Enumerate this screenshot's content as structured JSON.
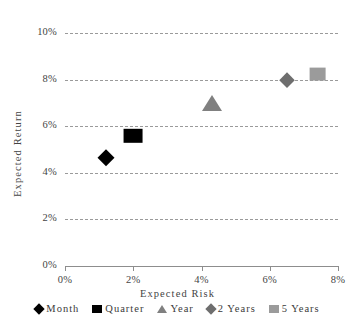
{
  "chart_data": {
    "type": "scatter",
    "title": "",
    "xlabel": "Expected Risk",
    "ylabel": "Expected Return",
    "xlim": [
      0,
      8
    ],
    "ylim": [
      0,
      10
    ],
    "xticks": [
      "0%",
      "2%",
      "4%",
      "6%",
      "8%"
    ],
    "yticks": [
      "0%",
      "2%",
      "4%",
      "6%",
      "8%",
      "10%"
    ],
    "xtick_values": [
      0,
      2,
      4,
      6,
      8
    ],
    "ytick_values": [
      0,
      2,
      4,
      6,
      8,
      10
    ],
    "grid": true,
    "grid_style": "dashed-horizontal",
    "legend_position": "bottom",
    "points": [
      {
        "name": "Month",
        "x": 1.2,
        "y": 4.65,
        "marker": "diamond",
        "color": "#000000",
        "size": 17
      },
      {
        "name": "Quarter",
        "x": 2.0,
        "y": 5.6,
        "marker": "square",
        "color": "#000000",
        "size": 18
      },
      {
        "name": "Year",
        "x": 4.3,
        "y": 7.0,
        "marker": "triangle",
        "color": "#808080",
        "size": 20
      },
      {
        "name": "2 Years",
        "x": 6.5,
        "y": 8.0,
        "marker": "diamond",
        "color": "#6e6e6e",
        "size": 15
      },
      {
        "name": "5 Years",
        "x": 7.4,
        "y": 8.25,
        "marker": "square",
        "color": "#9b9b9b",
        "size": 16
      }
    ],
    "series": [
      {
        "name": "Month",
        "values": [
          {
            "x": 1.2,
            "y": 4.65
          }
        ]
      },
      {
        "name": "Quarter",
        "values": [
          {
            "x": 2.0,
            "y": 5.6
          }
        ]
      },
      {
        "name": "Year",
        "values": [
          {
            "x": 4.3,
            "y": 7.0
          }
        ]
      },
      {
        "name": "2 Years",
        "values": [
          {
            "x": 6.5,
            "y": 8.0
          }
        ]
      },
      {
        "name": "5 Years",
        "values": [
          {
            "x": 7.4,
            "y": 8.25
          }
        ]
      }
    ]
  },
  "legend": {
    "items": [
      {
        "label": "Month",
        "marker": "diamond",
        "color": "#000000"
      },
      {
        "label": "Quarter",
        "marker": "square",
        "color": "#000000"
      },
      {
        "label": "Year",
        "marker": "triangle",
        "color": "#808080"
      },
      {
        "label": "2 Years",
        "marker": "diamond",
        "color": "#6e6e6e"
      },
      {
        "label": "5 Years",
        "marker": "square",
        "color": "#9b9b9b"
      }
    ]
  },
  "colors": {
    "grid": "#9a9a9a",
    "axis": "#8d8d8d",
    "text": "#3a3a3a",
    "background": "#ffffff"
  }
}
